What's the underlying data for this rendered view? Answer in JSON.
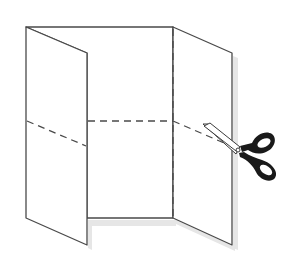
{
  "diagram": {
    "description": "Tri-fold paper sheet with dashed fold lines and scissors cutting along a dashed line",
    "colors": {
      "background": "#ffffff",
      "outline": "#4a4a4a",
      "dash": "#4a4a4a",
      "shadow": "#e2e2e2",
      "scissors_handle": "#1a1a1a",
      "blade": "#ffffff"
    },
    "elements": {
      "left_panel": "folded-left-panel",
      "middle_panel": "center-panel",
      "right_panel": "folded-right-panel",
      "horizontal_cut_line": "dashed-cut-line",
      "fold_line": "dashed-fold-line",
      "tool": "scissors-icon"
    }
  }
}
